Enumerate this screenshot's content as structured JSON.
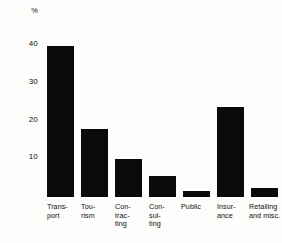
{
  "chart_data": {
    "type": "bar",
    "title": "",
    "subtitle": "",
    "xlabel": "",
    "ylabel": "%",
    "unit_label": "%",
    "categories": [
      "Transport",
      "Tourism",
      "Contracting",
      "Consulting",
      "Public",
      "Insurance",
      "Retailing and misc."
    ],
    "category_label_lines": [
      "Trans-\nport",
      "Tou-\nrism",
      "Con-\ntrac-\nting",
      "Con-\nsul-\nting",
      "Public",
      "Insur-\nance",
      "Retailing\nand misc."
    ],
    "values": [
      40,
      18,
      10,
      5.5,
      1.5,
      24,
      2.5
    ],
    "ytick_labels": [
      "40",
      "30",
      "20",
      "10"
    ],
    "yticks": [
      40,
      30,
      20,
      10
    ],
    "ylim": [
      0,
      42
    ],
    "xlim": [
      0,
      7
    ],
    "grid": false,
    "legend": false,
    "legend_position": "none",
    "bar_color": "#0a0a0a",
    "background_color": "#fdfdfb",
    "text_color": "#111111",
    "annotations": []
  },
  "axis": {
    "unit": "%",
    "tick_40": "40",
    "tick_30": "30",
    "tick_20": "20",
    "tick_10": "10"
  },
  "bars": [
    {
      "label": "Trans-\nport",
      "value": 40
    },
    {
      "label": "Tou-\nrism",
      "value": 18
    },
    {
      "label": "Con-\ntrac-\nting",
      "value": 10
    },
    {
      "label": "Con-\nsul-\nting",
      "value": 5.5
    },
    {
      "label": "Public",
      "value": 1.5
    },
    {
      "label": "Insur-\nance",
      "value": 24
    },
    {
      "label": "Retailing\nand misc.",
      "value": 2.5
    }
  ]
}
